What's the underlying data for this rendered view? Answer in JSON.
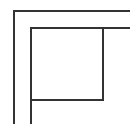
{
  "diagram": {
    "type": "line-drawing",
    "stroke_color": "#333333",
    "background_color": "#ffffff",
    "stroke_width": 2,
    "shapes": {
      "outer_corner": {
        "points": "14,124 14,11 130,11"
      },
      "inner_corner": {
        "points": "31,124 31,28 130,28"
      },
      "inner_square": {
        "x": 31,
        "y": 28,
        "width": 72,
        "height": 72
      }
    }
  }
}
